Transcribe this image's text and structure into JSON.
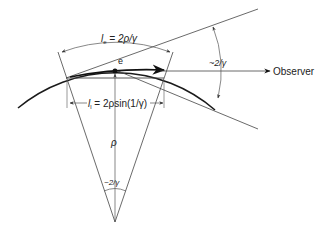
{
  "diagram": {
    "labels": {
      "emission_length": "l",
      "emission_length_sub": "e",
      "emission_length_eq": " = 2ρ/γ",
      "chord_length": "l",
      "chord_length_sub": "l",
      "chord_length_eq": " = 2ρsin(1/γ)",
      "electron": "e",
      "radius": "ρ",
      "cone_angle": "~2/γ",
      "center_angle": "~2/γ",
      "observer": "Observer"
    },
    "colors": {
      "stroke": "#222222",
      "thin_stroke": "#555555",
      "background": "#ffffff"
    }
  }
}
